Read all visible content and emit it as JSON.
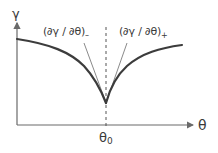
{
  "diagram": {
    "type": "cusp-plot",
    "y_axis_label": "γ",
    "x_axis_label": "θ",
    "marker_label": "θ",
    "marker_subscript": "0",
    "left_tangent": {
      "expression": "(∂γ / ∂θ)",
      "subscript": "–"
    },
    "right_tangent": {
      "expression": "(∂γ / ∂θ)",
      "subscript": "+"
    },
    "colors": {
      "curve": "#3c3c3c",
      "tangent": "#8a8a8a",
      "axis": "#6a6a6a",
      "dashed": "#555555",
      "text": "#3a3a3a"
    }
  }
}
